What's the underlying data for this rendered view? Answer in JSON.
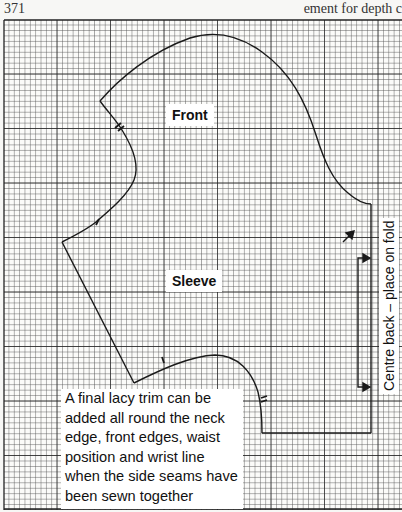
{
  "header": {
    "page_number": "371",
    "running_head": "ement for depth c"
  },
  "pattern": {
    "labels": {
      "front": "Front",
      "sleeve": "Sleeve",
      "fold": "Centre back – place on fold"
    },
    "note": "A final lacy trim can be added all round the neck edge, front edges, waist position and wrist line when the side seams have been sewn together",
    "colors": {
      "line": "#1a1a1a",
      "grid_minor": "#5a5a5a",
      "grid_major": "#222222",
      "paper": "#f7f7f5"
    }
  }
}
